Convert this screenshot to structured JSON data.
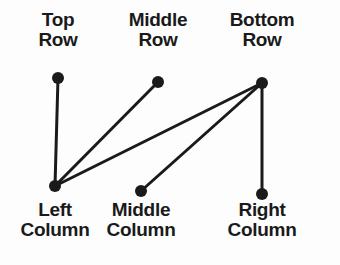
{
  "diagram": {
    "background_color": "#fdfdfd",
    "stroke_color": "#1a1a1a",
    "node_radius": 6,
    "edge_width": 3,
    "nodes": [
      {
        "id": "top-row",
        "label": "Top\nRow",
        "x": 58,
        "y": 78,
        "group": "row"
      },
      {
        "id": "middle-row",
        "label": "Middle\nRow",
        "x": 158,
        "y": 82,
        "group": "row"
      },
      {
        "id": "bottom-row",
        "label": "Bottom\nRow",
        "x": 262,
        "y": 83,
        "group": "row"
      },
      {
        "id": "left-column",
        "label": "Left\nColumn",
        "x": 55,
        "y": 186,
        "group": "column"
      },
      {
        "id": "middle-column",
        "label": "Middle\nColumn",
        "x": 141,
        "y": 191,
        "group": "column"
      },
      {
        "id": "right-column",
        "label": "Right\nColumn",
        "x": 262,
        "y": 194,
        "group": "column"
      }
    ],
    "edges": [
      {
        "id": "edge-top-row-left-column",
        "from": "top-row",
        "to": "left-column"
      },
      {
        "id": "edge-middle-row-left-column",
        "from": "middle-row",
        "to": "left-column"
      },
      {
        "id": "edge-bottom-row-left-column",
        "from": "bottom-row",
        "to": "left-column"
      },
      {
        "id": "edge-bottom-row-middle-column",
        "from": "bottom-row",
        "to": "middle-column"
      },
      {
        "id": "edge-bottom-row-right-column",
        "from": "bottom-row",
        "to": "right-column"
      }
    ],
    "labels": {
      "top_row": "Top\nRow",
      "middle_row": "Middle\nRow",
      "bottom_row": "Bottom\nRow",
      "left_column": "Left\nColumn",
      "middle_column": "Middle\nColumn",
      "right_column": "Right\nColumn"
    }
  }
}
